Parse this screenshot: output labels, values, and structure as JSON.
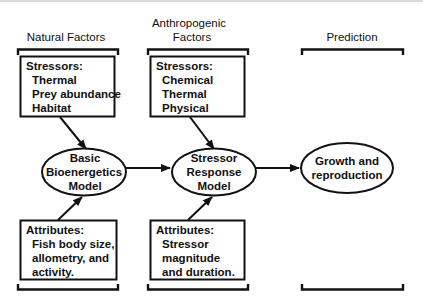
{
  "columns": [
    {
      "id": "natural",
      "header_lines": [
        "Natural Factors"
      ],
      "stressors_box": {
        "title": "Stressors:",
        "items": [
          "Thermal",
          "Prey abundance",
          "Habitat"
        ]
      },
      "model": {
        "lines": [
          "Basic",
          "Bioenergetics",
          "Model"
        ]
      },
      "attributes_box": {
        "title": "Attributes:",
        "items": [
          "Fish body size,",
          "allometry, and",
          "activity."
        ]
      }
    },
    {
      "id": "anthropogenic",
      "header_lines": [
        "Anthropogenic",
        "Factors"
      ],
      "stressors_box": {
        "title": "Stressors:",
        "items": [
          "Chemical",
          "Thermal",
          "Physical"
        ]
      },
      "model": {
        "lines": [
          "Stressor",
          "Response",
          "Model"
        ]
      },
      "attributes_box": {
        "title": "Attributes:",
        "items": [
          "Stressor",
          "magnitude",
          "and duration."
        ]
      }
    },
    {
      "id": "prediction",
      "header_lines": [
        "Prediction"
      ],
      "model": {
        "lines": [
          "Growth and",
          "reproduction"
        ]
      }
    }
  ],
  "colors": {
    "ink": "#111111",
    "background": "#ffffff",
    "top_rule": "#d9d9d9"
  }
}
